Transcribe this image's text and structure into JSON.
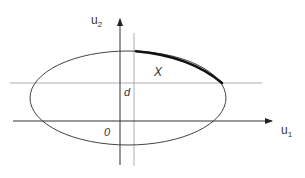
{
  "diagram": {
    "axes": {
      "horizontal_label_main": "u",
      "horizontal_label_sub": "1",
      "vertical_label_main": "u",
      "vertical_label_sub": "2"
    },
    "labels": {
      "origin": "0",
      "offset": "d",
      "region": "X"
    },
    "colors": {
      "axis": "#333333",
      "ellipse": "#444444",
      "dotted": "#999999",
      "highlight_arc": "#111111"
    }
  }
}
